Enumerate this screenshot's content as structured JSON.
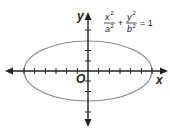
{
  "diagram": {
    "type": "ellipse-on-axes",
    "equation": {
      "x_num": "x",
      "x_num_exp": "2",
      "x_den": "a",
      "x_den_exp": "2",
      "plus": "+",
      "y_num": "y",
      "y_num_exp": "2",
      "y_den": "b",
      "y_den_exp": "2",
      "equals": "= 1"
    },
    "axes": {
      "x_label": "x",
      "y_label": "y",
      "origin_label": "O",
      "x_ticks_each_side": 6,
      "y_ticks_each_side": 3
    },
    "colors": {
      "axis": "#222222",
      "ellipse": "#808080",
      "text": "#222222"
    }
  }
}
